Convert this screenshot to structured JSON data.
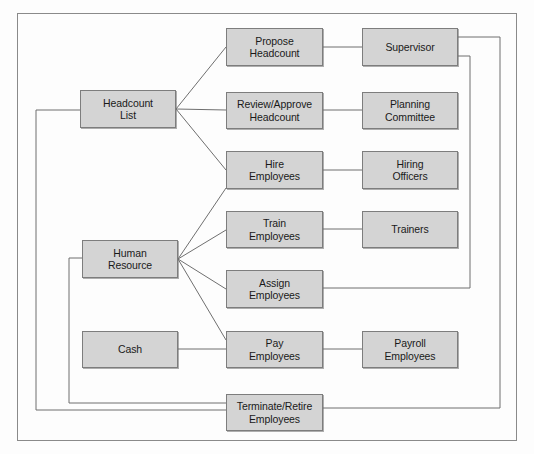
{
  "diagram": {
    "type": "flow-diagram",
    "frame": {
      "x": 17,
      "y": 13,
      "width": 500,
      "height": 428,
      "border_color": "#888888"
    },
    "style": {
      "node_fill": "#d4d4d4",
      "node_border": "#7d7d7d",
      "connector_color": "#6f6f6f",
      "text_color": "#1a1a1a",
      "background": "#fdfdfd"
    },
    "nodes": [
      {
        "id": "headcount-list",
        "label": "Headcount\nList",
        "x": 80,
        "y": 90,
        "width": 96,
        "height": 38
      },
      {
        "id": "human-resource",
        "label": "Human\nResource",
        "x": 82,
        "y": 240,
        "width": 96,
        "height": 38
      },
      {
        "id": "cash",
        "label": "Cash",
        "x": 82,
        "y": 331,
        "width": 96,
        "height": 37
      },
      {
        "id": "propose-headcount",
        "label": "Propose\nHeadcount",
        "x": 226,
        "y": 28,
        "width": 97,
        "height": 38
      },
      {
        "id": "review-approve-headcount",
        "label": "Review/Approve\nHeadcount",
        "x": 226,
        "y": 92,
        "width": 97,
        "height": 37
      },
      {
        "id": "hire-employees",
        "label": "Hire\nEmployees",
        "x": 226,
        "y": 151,
        "width": 97,
        "height": 38
      },
      {
        "id": "train-employees",
        "label": "Train\nEmployees",
        "x": 226,
        "y": 211,
        "width": 97,
        "height": 37
      },
      {
        "id": "assign-employees",
        "label": "Assign\nEmployees",
        "x": 226,
        "y": 270,
        "width": 97,
        "height": 38
      },
      {
        "id": "pay-employees",
        "label": "Pay\nEmployees",
        "x": 226,
        "y": 331,
        "width": 97,
        "height": 37
      },
      {
        "id": "terminate-retire-employees",
        "label": "Terminate/Retire\nEmployees",
        "x": 226,
        "y": 394,
        "width": 97,
        "height": 37
      },
      {
        "id": "supervisor",
        "label": "Supervisor",
        "x": 362,
        "y": 28,
        "width": 96,
        "height": 38
      },
      {
        "id": "planning-committee",
        "label": "Planning\nCommittee",
        "x": 362,
        "y": 92,
        "width": 96,
        "height": 37
      },
      {
        "id": "hiring-officers",
        "label": "Hiring\nOfficers",
        "x": 362,
        "y": 151,
        "width": 96,
        "height": 38
      },
      {
        "id": "trainers",
        "label": "Trainers",
        "x": 362,
        "y": 211,
        "width": 96,
        "height": 37
      },
      {
        "id": "payroll-employees",
        "label": "Payroll\nEmployees",
        "x": 362,
        "y": 331,
        "width": 96,
        "height": 37
      }
    ],
    "connectors": [
      {
        "id": "headcount-list-to-propose-headcount",
        "from": "headcount-list",
        "to": "propose-headcount",
        "path": "M176,109 L226,47"
      },
      {
        "id": "headcount-list-to-review-approve",
        "from": "headcount-list",
        "to": "review-approve-headcount",
        "path": "M176,109 L226,110"
      },
      {
        "id": "headcount-list-to-hire-employees",
        "from": "headcount-list",
        "to": "hire-employees",
        "path": "M176,109 L226,170"
      },
      {
        "id": "propose-headcount-to-supervisor",
        "from": "propose-headcount",
        "to": "supervisor",
        "path": "M323,47 L362,47"
      },
      {
        "id": "review-approve-to-planning-committee",
        "from": "review-approve-headcount",
        "to": "planning-committee",
        "path": "M323,110 L362,110"
      },
      {
        "id": "hire-employees-to-hiring-officers",
        "from": "hire-employees",
        "to": "hiring-officers",
        "path": "M323,170 L362,170"
      },
      {
        "id": "train-employees-to-trainers",
        "from": "train-employees",
        "to": "trainers",
        "path": "M323,229 L362,229"
      },
      {
        "id": "pay-employees-to-payroll-employees",
        "from": "pay-employees",
        "to": "payroll-employees",
        "path": "M323,349 L362,349"
      },
      {
        "id": "human-resource-to-hire-employees",
        "from": "human-resource",
        "to": "hire-employees",
        "path": "M178,259 L226,188"
      },
      {
        "id": "human-resource-to-train-employees",
        "from": "human-resource",
        "to": "train-employees",
        "path": "M178,259 L226,230"
      },
      {
        "id": "human-resource-to-assign-employees",
        "from": "human-resource",
        "to": "assign-employees",
        "path": "M178,259 L226,289"
      },
      {
        "id": "human-resource-to-pay-employees",
        "from": "human-resource",
        "to": "pay-employees",
        "path": "M178,259 L226,340"
      },
      {
        "id": "cash-to-pay-employees",
        "from": "cash",
        "to": "pay-employees",
        "path": "M178,349 L226,349"
      },
      {
        "id": "headcount-list-left-loop-to-terminate",
        "from": "headcount-list",
        "to": "terminate-retire-employees",
        "path": "M80,110 L36,110 L36,410 L226,410"
      },
      {
        "id": "human-resource-left-loop-to-terminate",
        "from": "human-resource",
        "to": "terminate-retire-employees",
        "path": "M82,258 L69,258 L69,403 L226,403"
      },
      {
        "id": "supervisor-right-loop-to-terminate",
        "from": "supervisor",
        "to": "terminate-retire-employees",
        "path": "M458,37 L500,37 L500,408 L323,408"
      },
      {
        "id": "supervisor-right-loop-to-assign-employees",
        "from": "supervisor",
        "to": "assign-employees",
        "path": "M458,56 L470,56 L470,288 L323,288"
      }
    ]
  }
}
